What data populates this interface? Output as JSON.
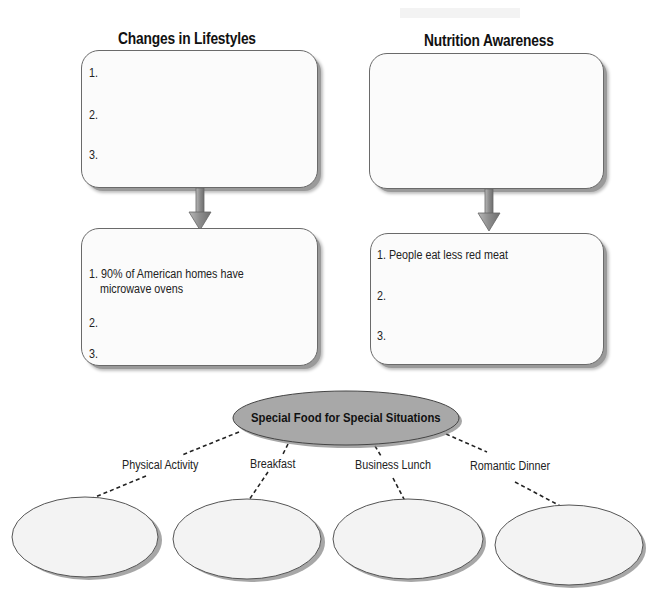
{
  "columns": [
    {
      "heading": "Changes in Lifestyles",
      "top_box": {
        "items": [
          "1.",
          "2.",
          "3."
        ]
      },
      "bottom_box": {
        "items": [
          "1. 90% of American homes have",
          "microwave ovens",
          "2.",
          "3."
        ]
      }
    },
    {
      "heading": "Nutrition Awareness",
      "top_box": {
        "items": []
      },
      "bottom_box": {
        "items": [
          "1. People eat less red meat",
          "2.",
          "3."
        ]
      }
    }
  ],
  "web": {
    "center": "Special Food for Special Situations",
    "branches": [
      {
        "label": "Physical Activity"
      },
      {
        "label": "Breakfast"
      },
      {
        "label": "Business Lunch"
      },
      {
        "label": "Romantic Dinner"
      }
    ]
  },
  "colors": {
    "box_border": "#6a6a6a",
    "box_fill": "#fbfbfb",
    "center_fill": "#a8a8a8",
    "ellipse_fill": "#f3f3f3",
    "arrow": "#8e8e8e"
  }
}
